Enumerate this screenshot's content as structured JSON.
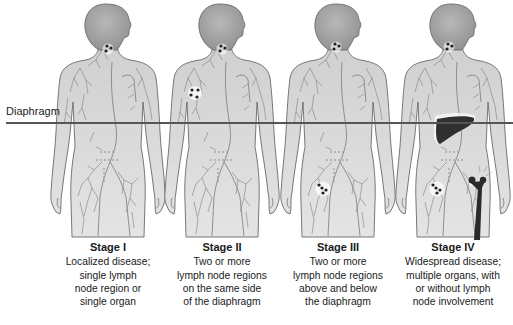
{
  "diagram": {
    "diaphragm_label": "Diaphragm",
    "colors": {
      "body_fill": "#d6d6d6",
      "body_stroke": "#6a6a6a",
      "vessel": "#7a7a7a",
      "node": "#2a2a2a",
      "organ": "#303030",
      "diaphragm_line": "#555555"
    },
    "stages": [
      {
        "title": "Stage I",
        "lines": [
          "Localized disease;",
          "single lymph",
          "node region or",
          "single organ"
        ],
        "affected": [
          "neck lymph nodes"
        ]
      },
      {
        "title": "Stage II",
        "lines": [
          "Two or more",
          "lymph node regions",
          "on the same side",
          "of the diaphragm"
        ],
        "affected": [
          "neck lymph nodes",
          "axillary lymph nodes"
        ]
      },
      {
        "title": "Stage III",
        "lines": [
          "Two or more",
          "lymph node regions",
          "above and below",
          "the diaphragm"
        ],
        "affected": [
          "neck lymph nodes",
          "inguinal lymph nodes"
        ]
      },
      {
        "title": "Stage IV",
        "lines": [
          "Widespread disease;",
          "multiple organs, with",
          "or without lymph",
          "node involvement"
        ],
        "affected": [
          "neck lymph nodes",
          "inguinal lymph nodes",
          "liver",
          "femur (bone)"
        ]
      }
    ]
  }
}
